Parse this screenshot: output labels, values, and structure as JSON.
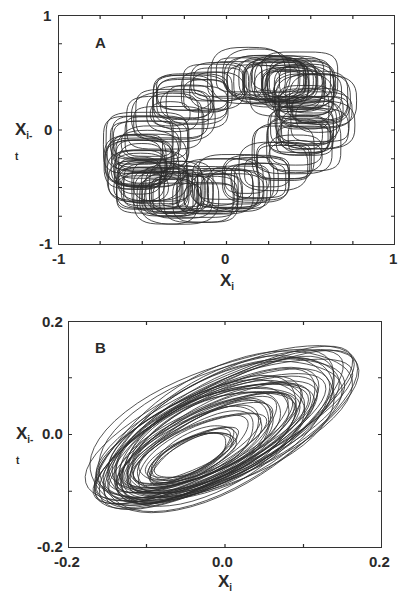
{
  "chart_data": [
    {
      "type": "line",
      "panel": "A",
      "title": "",
      "xlabel": "Xi",
      "ylabel": "Xi-t",
      "xlim": [
        -1,
        1
      ],
      "ylim": [
        -1,
        1
      ],
      "x_tick_labels": [
        "-1",
        "0",
        "1"
      ],
      "y_tick_labels": [
        "1",
        "0",
        "-1"
      ],
      "minor_ticks_every": 0.25,
      "grid": false,
      "legend": null,
      "description": "Delay-embedding phase portrait: ring of overlapping loops forming an elliptical annulus tilted along y=x, centered near (0,0), extending from about (-0.6,-0.9) to (0.6,0.8)",
      "series": [
        {
          "name": "trajectory",
          "shape": "annulus-of-loops",
          "center": [
            0.0,
            0.0
          ],
          "ring_radius_major": 0.62,
          "ring_radius_minor": 0.38,
          "tilt_deg": 45,
          "loop_radius": 0.18,
          "loops": 150
        }
      ]
    },
    {
      "type": "line",
      "panel": "B",
      "title": "",
      "xlabel": "Xi",
      "ylabel": "Xi-t",
      "xlim": [
        -0.2,
        0.2
      ],
      "ylim": [
        -0.2,
        0.2
      ],
      "x_tick_labels": [
        "-0.2",
        "0.0",
        "0.2"
      ],
      "y_tick_labels": [
        "0.2",
        "0.0",
        "-0.2"
      ],
      "minor_ticks_every": 0.1,
      "grid": false,
      "legend": null,
      "description": "Delay-embedding phase portrait: nested tilted elliptical orbits, center near (-0.02,0.0), inner hole near (-0.06,-0.06), extending roughly x -0.18..0.16, y -0.18..0.17",
      "series": [
        {
          "name": "trajectory",
          "shape": "nested-ellipses",
          "center": [
            -0.02,
            0.0
          ],
          "hole_center": [
            -0.06,
            -0.06
          ],
          "max_semi_major": 0.2,
          "max_semi_minor": 0.085,
          "tilt_deg": 38,
          "orbits": 55
        }
      ]
    }
  ],
  "panels": {
    "A": {
      "label": "A",
      "x_ticks": {
        "left": "-1",
        "mid": "0",
        "right": "1"
      },
      "y_ticks": {
        "top": "1",
        "mid": "0",
        "bottom": "-1"
      },
      "xlabel_main": "X",
      "xlabel_sub": "i",
      "ylabel_main": "X",
      "ylabel_sub": "i-t"
    },
    "B": {
      "label": "B",
      "x_ticks": {
        "left": "-0.2",
        "mid": "0.0",
        "right": "0.2"
      },
      "y_ticks": {
        "top": "0.2",
        "mid": "0.0",
        "bottom": "-0.2"
      },
      "xlabel_main": "X",
      "xlabel_sub": "i",
      "ylabel_main": "X",
      "ylabel_sub": "i-t"
    }
  },
  "style": {
    "line_color": "#2b2b2b",
    "frame_color": "#333333"
  }
}
